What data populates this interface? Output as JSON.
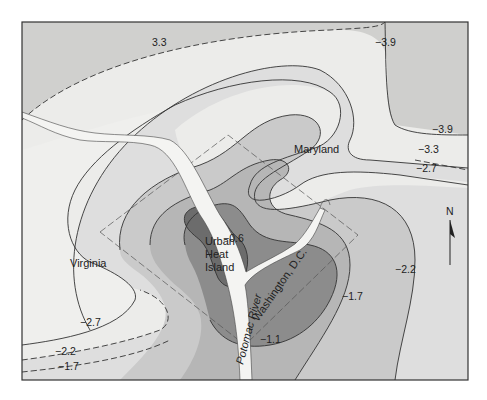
{
  "map": {
    "title": "Urban Heat Island contour map",
    "colors": {
      "frame": "#333333",
      "zone_lightest": "#eeeeec",
      "zone_light": "#dcdcda",
      "zone_mid_light": "#cacaca",
      "zone_mid": "#b3b3b3",
      "zone_dark": "#8f8f8f",
      "zone_darkest": "#6e6e6e",
      "outer_band": "#c9c9c7",
      "river": "#f4f4f2",
      "line": "#333333"
    },
    "region_labels": {
      "maryland": "Maryland",
      "virginia": "Virginia",
      "washington_dc": "Washington, D.C.",
      "potomac": "Potomac River",
      "uhi_line1": "Urban",
      "uhi_line2": "Heat",
      "uhi_line3": "Island"
    },
    "contour_labels": {
      "top_33": "3.3",
      "top_right_39": "−3.9",
      "right_39": "−3.9",
      "right_33": "−3.3",
      "right_27": "−2.7",
      "center_06": "−0.6",
      "right_22": "−2.2",
      "right_17": "−1.7",
      "bottom_11": "−1.1",
      "left_27": "−2.7",
      "left_22": "−2.2",
      "left_17": "−1.7"
    },
    "compass": {
      "label": "N"
    },
    "isotherm_values": [
      -3.9,
      -3.3,
      -2.7,
      -2.2,
      -1.7,
      -1.1,
      -0.6
    ]
  }
}
